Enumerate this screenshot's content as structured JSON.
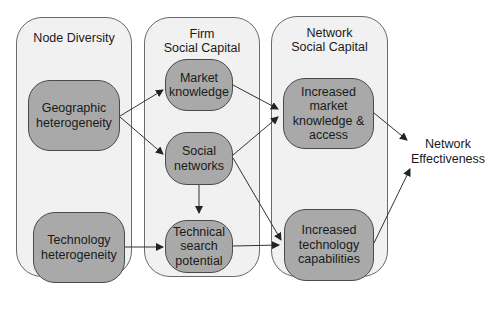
{
  "columns": [
    {
      "id": "node-diversity",
      "title": "Node Diversity"
    },
    {
      "id": "firm-social-capital",
      "title": "Firm\nSocial Capital"
    },
    {
      "id": "network-social-capital",
      "title": "Network\nSocial Capital"
    }
  ],
  "nodes": {
    "geographic": "Geographic\nheterogeneity",
    "technology": "Technology\nheterogeneity",
    "market_knowledge": "Market\nknowledge",
    "social_networks": "Social\nnetworks",
    "technical_search": "Technical\nsearch\npotential",
    "increased_market": "Increased\nmarket\nknowledge &\naccess",
    "increased_technology": "Increased\ntechnology\ncapabilities"
  },
  "outcome": "Network\nEffectiveness",
  "edges": [
    {
      "from": "Geographic heterogeneity",
      "to": "Market knowledge"
    },
    {
      "from": "Geographic heterogeneity",
      "to": "Social networks"
    },
    {
      "from": "Technology heterogeneity",
      "to": "Technical search potential"
    },
    {
      "from": "Market knowledge",
      "to": "Increased market knowledge & access"
    },
    {
      "from": "Social networks",
      "to": "Increased market knowledge & access"
    },
    {
      "from": "Social networks",
      "to": "Technical search potential"
    },
    {
      "from": "Social networks",
      "to": "Increased technology capabilities"
    },
    {
      "from": "Technical search potential",
      "to": "Increased technology capabilities"
    },
    {
      "from": "Increased market knowledge & access",
      "to": "Network Effectiveness"
    },
    {
      "from": "Increased technology capabilities",
      "to": "Network Effectiveness"
    }
  ],
  "colors": {
    "column_fill": "#f1f1f1",
    "node_fill": "#a9a9a9",
    "stroke": "#4a4a4a"
  }
}
